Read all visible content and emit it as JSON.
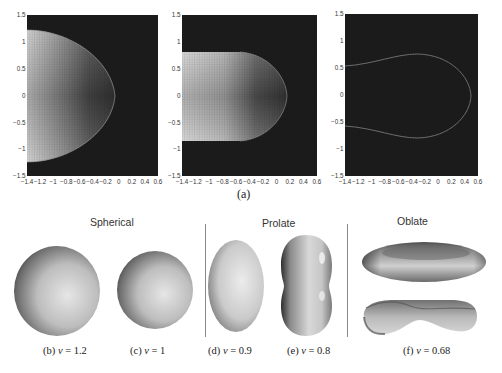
{
  "figure": {
    "panel_a_label": "(a)",
    "groups": [
      {
        "label": "Spherical"
      },
      {
        "label": "Prolate"
      },
      {
        "label": "Oblate"
      }
    ],
    "captions": [
      {
        "prefix": "(b)",
        "symbol": "ν",
        "value": "= 1.2"
      },
      {
        "prefix": "(c)",
        "symbol": "ν",
        "value": "= 1"
      },
      {
        "prefix": "(d)",
        "symbol": "ν",
        "value": "= 0.9"
      },
      {
        "prefix": "(e)",
        "symbol": "ν",
        "value": "= 0.8"
      },
      {
        "prefix": "(f)",
        "symbol": "ν",
        "value": "= 0.68"
      }
    ],
    "shapes": [
      {
        "id": "b",
        "type": "sphere",
        "nu": 1.2
      },
      {
        "id": "c",
        "type": "sphere",
        "nu": 1
      },
      {
        "id": "d",
        "type": "prolate-ellipsoid",
        "nu": 0.9
      },
      {
        "id": "e",
        "type": "prolate-peanut",
        "nu": 0.8
      },
      {
        "id": "f",
        "type": "oblate-discocyte",
        "nu": 0.68,
        "views": [
          "top-oblique",
          "side-cut"
        ]
      }
    ],
    "colors": {
      "plot_background": "#1c1c1c",
      "shape_fill_bright": "#bdbdbd",
      "contour": "#8a8a8a",
      "divider": "#888888"
    }
  },
  "chart_data": [
    {
      "type": "heatmap",
      "title": "",
      "xlabel": "",
      "ylabel": "",
      "xlim": [
        -1.4,
        0.6
      ],
      "ylim": [
        -1.5,
        1.5
      ],
      "xticks": [
        "-1.4",
        "-1.2",
        "-1",
        "-0.8",
        "-0.6",
        "-0.4",
        "-0.2",
        "0",
        "0.2",
        "0.4",
        "0.6"
      ],
      "yticks": [
        "1.5",
        "1",
        "0.5",
        "0",
        "-0.5",
        "-1",
        "-1.5"
      ],
      "grid": false,
      "description": "Phase-field cross-section; bright region bounded by half-ellipse",
      "boundary": {
        "half_height": 1.25,
        "tip_x": -0.2
      }
    },
    {
      "type": "heatmap",
      "title": "",
      "xlabel": "",
      "ylabel": "",
      "xlim": [
        -1.4,
        0.6
      ],
      "ylim": [
        -1.5,
        1.5
      ],
      "xticks": [
        "-1.4",
        "-1.2",
        "-1",
        "-0.8",
        "-0.6",
        "-0.4",
        "-0.2",
        "0",
        "0.2",
        "0.4",
        "0.6"
      ],
      "yticks": [
        "1.5",
        "1",
        "0.5",
        "0",
        "-0.5",
        "-1",
        "-1.5"
      ],
      "grid": false,
      "description": "Elongated bright region with rounded tip",
      "boundary": {
        "half_height": 0.82,
        "tip_x": 0.15
      }
    },
    {
      "type": "heatmap",
      "title": "",
      "xlabel": "",
      "ylabel": "",
      "xlim": [
        -1.4,
        0.6
      ],
      "ylim": [
        -1.5,
        1.5
      ],
      "xticks": [
        "-1.4",
        "-1.2",
        "-1",
        "-0.8",
        "-0.6",
        "-0.4",
        "-0.2",
        "0",
        "0.2",
        "0.4",
        "0.6"
      ],
      "yticks": [
        "1.5",
        "1",
        "0.5",
        "0",
        "-0.5",
        "-1",
        "-1.5"
      ],
      "grid": false,
      "description": "Dark field with thin contour outlining bulb shape",
      "boundary": {
        "left_half_height": 0.57,
        "max_half_height": 0.78,
        "max_at_x": -0.35,
        "tip_x": 0.45
      }
    }
  ]
}
